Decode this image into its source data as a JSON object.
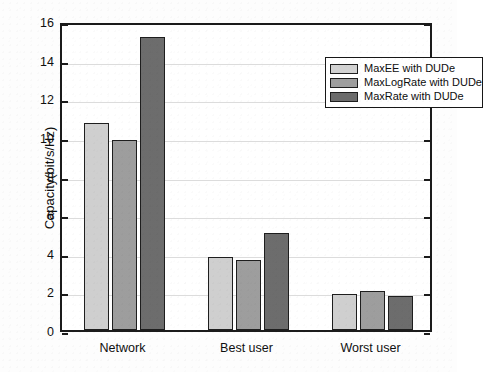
{
  "chart_data": {
    "type": "bar",
    "title": "",
    "xlabel": "",
    "ylabel": "Capacity(bit/s/Hz)",
    "categories": [
      "Network",
      "Best user",
      "Worst user"
    ],
    "series": [
      {
        "name": "MaxEE with DUDe",
        "color": "#d2d2d2",
        "values": [
          10.7,
          3.8,
          1.85
        ]
      },
      {
        "name": "MaxLogRate with DUDe",
        "color": "#9e9e9e",
        "values": [
          9.85,
          3.65,
          2.0
        ]
      },
      {
        "name": "MaxRate with DUDe",
        "color": "#6b6b6b",
        "values": [
          15.15,
          5.0,
          1.75
        ]
      }
    ],
    "ylim": [
      0,
      16
    ],
    "yticks": [
      0,
      2,
      4,
      6,
      8,
      10,
      12,
      14,
      16
    ],
    "ytick_labels": [
      "0",
      "2",
      "4",
      "6",
      "8",
      "10",
      "12",
      "14",
      "16"
    ],
    "grid": true,
    "grid_axis": "y",
    "legend_position": "upper right",
    "bar_edge_color": "#1e1e1e",
    "axis_color": "#1b1b1b",
    "background_color": "#ffffff"
  },
  "legend": {
    "entries": [
      {
        "label": "MaxEE with DUDe"
      },
      {
        "label": "MaxLogRate with DUDe"
      },
      {
        "label": "MaxRate with DUDe"
      }
    ]
  }
}
